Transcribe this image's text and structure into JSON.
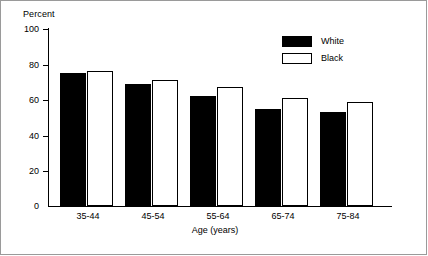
{
  "chart_data": {
    "type": "bar",
    "title": "",
    "xlabel": "Age (years)",
    "ylabel": "Percent",
    "ylim": [
      0,
      100
    ],
    "yticks": [
      0,
      20,
      40,
      60,
      80,
      100
    ],
    "grid": false,
    "legend_position": "top-right",
    "categories": [
      "35-44",
      "45-54",
      "55-64",
      "65-74",
      "75-84"
    ],
    "series": [
      {
        "name": "White",
        "style": "filled-black",
        "values": [
          75,
          69,
          62,
          55,
          53
        ]
      },
      {
        "name": "Black",
        "style": "outlined-white",
        "values": [
          76,
          71,
          67,
          61,
          59
        ]
      }
    ]
  },
  "axes": {
    "y_title": "Percent",
    "x_title": "Age (years)",
    "y_tick_labels": [
      "100",
      "80",
      "60",
      "40",
      "20",
      "0"
    ],
    "x_tick_labels": [
      "35-44",
      "45-54",
      "55-64",
      "65-74",
      "75-84"
    ]
  },
  "legend": {
    "entries": [
      {
        "label": "White",
        "swatch": "filled-black-swatch"
      },
      {
        "label": "Black",
        "swatch": "outlined-white-swatch"
      }
    ]
  },
  "colors": {
    "series_white": "#000000",
    "series_black": "#ffffff",
    "axis": "#000000",
    "frame": "#9a9a9a",
    "background": "#ffffff"
  }
}
